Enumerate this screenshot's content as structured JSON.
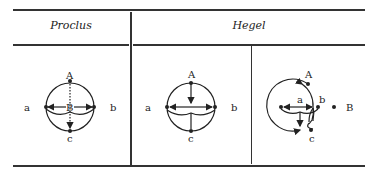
{
  "table": {
    "headers": {
      "left": "Proclus",
      "right": "Hegel"
    },
    "diagrams": [
      {
        "id": "proclus",
        "labels": {
          "top": "A",
          "center": "B",
          "left": "a",
          "right": "b",
          "bottom": "c"
        }
      },
      {
        "id": "hegel-1",
        "labels": {
          "top": "A",
          "left": "a",
          "right": "b",
          "bottom": "c"
        }
      },
      {
        "id": "hegel-2",
        "labels": {
          "top": "A",
          "inner_left": "a",
          "inner_right": "b",
          "outer_right": "B",
          "bottom": "c"
        }
      }
    ]
  },
  "colors": {
    "ink": "#222222",
    "background": "#ffffff"
  }
}
